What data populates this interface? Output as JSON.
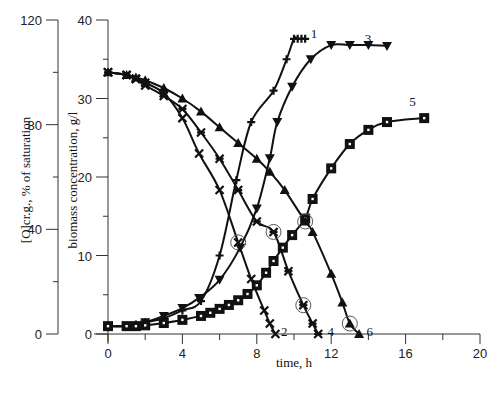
{
  "chart_data": {
    "type": "line",
    "title": "",
    "xlabel": "time, h",
    "ylabel_left": "[O]cr.g., % of saturation",
    "ylabel_right": "biomass concentration, g/l",
    "xlim": [
      0,
      20
    ],
    "ylim_left": [
      0,
      120
    ],
    "ylim_right": [
      0,
      40
    ],
    "x_ticks": [
      0,
      4,
      8,
      12,
      16,
      20
    ],
    "y_ticks_left": [
      0,
      40,
      80,
      120
    ],
    "y_ticks_right": [
      0,
      10,
      20,
      30,
      40
    ],
    "grid": false,
    "legend": "inline numeric labels 1-6 next to curves",
    "series": [
      {
        "name": "1",
        "quantity": "biomass",
        "axis": "right",
        "marker": "plus",
        "x": [
          0,
          1,
          1.5,
          2,
          3,
          4,
          5,
          6,
          6.9,
          7.7,
          8.9,
          9.6,
          10,
          10.2,
          10.4,
          10.6
        ],
        "y": [
          1,
          1,
          1.2,
          1.5,
          2,
          3,
          4.2,
          10,
          19.6,
          27,
          31,
          35,
          37.6,
          37.6,
          37.6,
          37.6
        ],
        "label_pos": [
          10.9,
          38.2
        ]
      },
      {
        "name": "2",
        "quantity": "dissolved oxygen",
        "axis": "left",
        "marker": "x",
        "x": [
          0,
          1,
          1.5,
          2,
          3,
          4,
          4.9,
          6,
          7,
          7.7,
          8.4,
          8.7,
          9
        ],
        "y": [
          100,
          99,
          97.5,
          96,
          92,
          82.5,
          69,
          55,
          35,
          21,
          9,
          4,
          0
        ],
        "circled_x": 7.0,
        "label_pos": [
          9.3,
          0.6
        ]
      },
      {
        "name": "3",
        "quantity": "biomass",
        "axis": "right",
        "marker": "triangle-down",
        "x": [
          0,
          1,
          2,
          3,
          4,
          4.9,
          6,
          7.1,
          8,
          8.7,
          9.1,
          9.9,
          10.9,
          12,
          13,
          14,
          15
        ],
        "y": [
          1,
          1,
          1.5,
          2.3,
          3.3,
          4.6,
          6.9,
          11,
          16,
          22.4,
          27,
          31.5,
          35,
          36.8,
          36.8,
          36.8,
          36.7
        ],
        "label_pos": [
          13.8,
          37.6
        ]
      },
      {
        "name": "4",
        "quantity": "dissolved oxygen",
        "axis": "left",
        "marker": "star",
        "x": [
          0,
          1,
          1.5,
          2,
          3,
          4,
          5,
          6,
          7,
          8,
          8.9,
          9.7,
          10.5,
          11,
          11.3
        ],
        "y": [
          100,
          99,
          97.5,
          95,
          91,
          86,
          77,
          67,
          55,
          43,
          39,
          24,
          11,
          4,
          0
        ],
        "circled_x": [
          8.9,
          10.5
        ],
        "label_pos": [
          11.8,
          0.6
        ]
      },
      {
        "name": "5",
        "quantity": "biomass",
        "axis": "right",
        "marker": "square",
        "x": [
          0,
          1,
          1.5,
          2,
          3,
          4,
          5,
          5.5,
          6,
          6.5,
          7,
          7.5,
          8,
          8.5,
          8.9,
          9.4,
          9.9,
          10.6,
          11,
          12,
          13,
          14,
          15,
          17
        ],
        "y": [
          1,
          1,
          1,
          1.1,
          1.4,
          1.8,
          2.3,
          2.7,
          3.2,
          3.7,
          4.3,
          5.1,
          6.2,
          7.8,
          9.3,
          11,
          12.6,
          14.7,
          17.2,
          21.1,
          24.2,
          26,
          27,
          27.5
        ],
        "label_pos": [
          16.2,
          29.5
        ]
      },
      {
        "name": "6",
        "quantity": "dissolved oxygen",
        "axis": "left",
        "marker": "triangle-up",
        "x": [
          0,
          1,
          1.5,
          2,
          3,
          4,
          5,
          6,
          7,
          8,
          8.7,
          9.5,
          10.6,
          11,
          12,
          12.6,
          13,
          13.5
        ],
        "y": [
          100,
          99,
          98,
          97,
          94,
          90,
          85,
          79,
          73,
          67,
          62,
          55,
          43,
          39,
          23,
          12,
          4,
          0
        ],
        "circled_x": [
          10.6,
          13
        ],
        "label_pos": [
          13.9,
          0.6
        ]
      }
    ]
  },
  "axes": {
    "left_axis_title": "[O]cr.g., % of saturation",
    "right_axis_title": "biomass concentration, g/l",
    "x_axis_title": "time, h"
  }
}
